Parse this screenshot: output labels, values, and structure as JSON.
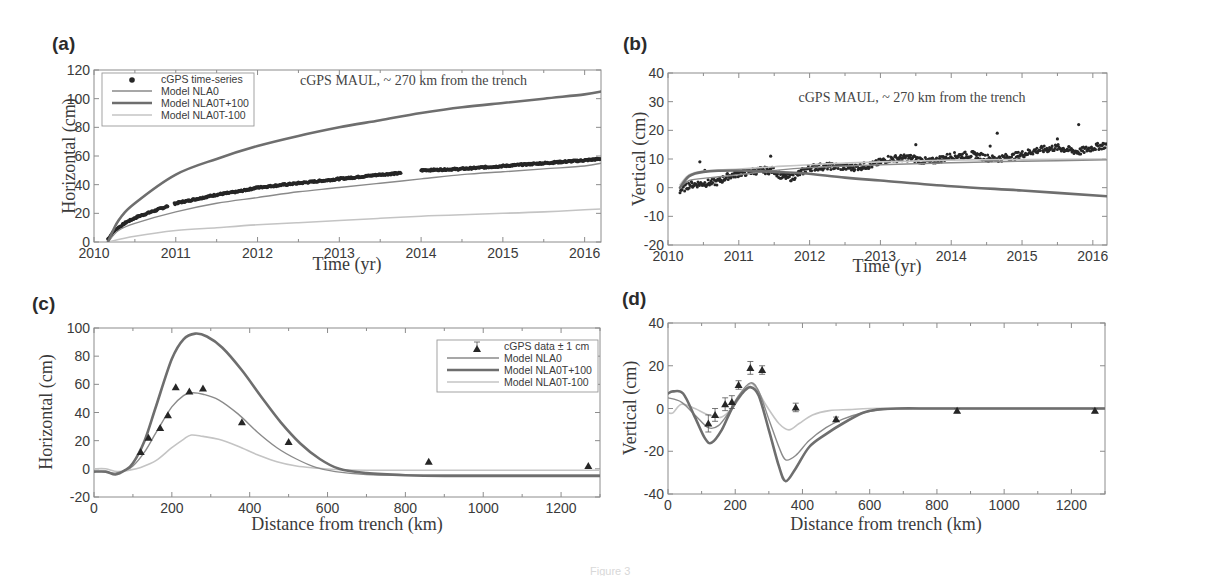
{
  "figure": {
    "caption_fragment": "Figure 3"
  },
  "colors": {
    "nla0": "#8a8a8a",
    "nla0t_plus": "#6e6e6e",
    "nla0t_minus": "#c4c4c4",
    "data": "#262626",
    "axis": "#8c8c8c"
  },
  "chart_data": [
    {
      "panel": "(a)",
      "type": "line",
      "title": "cGPS MAUL, ~ 270 km from the trench",
      "xlabel": "Time (yr)",
      "ylabel": "Horizontal (cm)",
      "xlim": [
        2010,
        2016.2
      ],
      "ylim": [
        0,
        120
      ],
      "xticks": [
        2010,
        2011,
        2012,
        2013,
        2014,
        2015,
        2016
      ],
      "yticks": [
        0,
        20,
        40,
        60,
        80,
        100,
        120
      ],
      "legend": {
        "position": "upper left",
        "entries": [
          "cGPS time-series",
          "Model NLA0",
          "Model NLA0T+100",
          "Model NLA0T-100"
        ]
      },
      "series": [
        {
          "name": "cGPS time-series",
          "kind": "scatter",
          "x": [
            2010.17,
            2010.25,
            2010.4,
            2010.55,
            2010.7,
            2010.85,
            2011.0,
            2011.25,
            2011.5,
            2011.75,
            2012.0,
            2012.5,
            2013.0,
            2013.5,
            2013.75,
            2014.0,
            2014.5,
            2015.0,
            2015.5,
            2016.0,
            2016.2
          ],
          "y": [
            2,
            8,
            14,
            18,
            21,
            24,
            27,
            30,
            33,
            35,
            38,
            41,
            44,
            47,
            48,
            50,
            51,
            53,
            55,
            57,
            58
          ],
          "gaps": [
            [
              2010.9,
              2010.98
            ],
            [
              2013.75,
              2014.0
            ]
          ]
        },
        {
          "name": "Model NLA0",
          "kind": "line",
          "x": [
            2010.17,
            2010.3,
            2010.5,
            2011.0,
            2011.5,
            2012.0,
            2012.5,
            2013.0,
            2013.5,
            2014.0,
            2014.5,
            2015.0,
            2015.5,
            2016.0,
            2016.2
          ],
          "y": [
            0,
            8,
            13,
            21,
            27,
            31,
            35,
            38,
            41,
            44,
            47,
            49,
            51,
            53,
            55
          ]
        },
        {
          "name": "Model NLA0T+100",
          "kind": "line",
          "x": [
            2010.17,
            2010.3,
            2010.5,
            2011.0,
            2011.5,
            2012.0,
            2012.5,
            2013.0,
            2013.5,
            2014.0,
            2014.5,
            2015.0,
            2015.5,
            2016.0,
            2016.2
          ],
          "y": [
            0,
            15,
            27,
            47,
            58,
            67,
            74,
            80,
            85,
            90,
            94,
            97,
            100,
            103,
            105
          ]
        },
        {
          "name": "Model NLA0T-100",
          "kind": "line",
          "x": [
            2010.17,
            2010.5,
            2011.0,
            2011.5,
            2012.0,
            2012.5,
            2013.0,
            2013.5,
            2014.0,
            2014.5,
            2015.0,
            2015.5,
            2016.0,
            2016.2
          ],
          "y": [
            0,
            4,
            8,
            10,
            12,
            13.5,
            15,
            16.5,
            18,
            19,
            20,
            21,
            22.5,
            23
          ]
        }
      ]
    },
    {
      "panel": "(b)",
      "type": "line",
      "title": "cGPS MAUL, ~ 270 km from the trench",
      "xlabel": "Time (yr)",
      "ylabel": "Vertical (cm)",
      "xlim": [
        2010,
        2016.2
      ],
      "ylim": [
        -20,
        40
      ],
      "xticks": [
        2010,
        2011,
        2012,
        2013,
        2014,
        2015,
        2016
      ],
      "yticks": [
        -20,
        -10,
        0,
        10,
        20,
        30,
        40
      ],
      "series": [
        {
          "name": "cGPS time-series",
          "kind": "scatter",
          "x": [
            2010.17,
            2010.3,
            2010.5,
            2010.7,
            2010.85,
            2011.0,
            2011.3,
            2011.5,
            2011.6,
            2011.75,
            2012.0,
            2012.3,
            2012.6,
            2012.9,
            2013.1,
            2013.4,
            2013.7,
            2014.0,
            2014.3,
            2014.6,
            2014.9,
            2015.2,
            2015.5,
            2015.8,
            2016.0,
            2016.2
          ],
          "y": [
            -1,
            1,
            1.5,
            2,
            4,
            5,
            6,
            6,
            4,
            3.5,
            7,
            7.5,
            7,
            8,
            10,
            10.5,
            9,
            11,
            11.5,
            10,
            11,
            13,
            14,
            12.5,
            14,
            15
          ],
          "outliers": {
            "x": [
              2010.45,
              2010.52,
              2011.45,
              2013.5,
              2014.55,
              2014.65,
              2015.5,
              2015.8
            ],
            "y": [
              9,
              6,
              11,
              15,
              14.5,
              19,
              17,
              22
            ]
          }
        },
        {
          "name": "Model NLA0",
          "kind": "line",
          "x": [
            2010.17,
            2010.3,
            2010.6,
            2011.0,
            2011.5,
            2012.0,
            2013.0,
            2014.0,
            2015.0,
            2016.2
          ],
          "y": [
            0,
            2.5,
            3.5,
            4.5,
            6,
            7,
            8,
            8.7,
            9.2,
            9.7
          ]
        },
        {
          "name": "Model NLA0T+100",
          "kind": "line",
          "x": [
            2010.17,
            2010.3,
            2010.5,
            2011.0,
            2011.5,
            2011.9,
            2012.5,
            2013.0,
            2014.0,
            2015.0,
            2016.2
          ],
          "y": [
            0,
            4,
            5.5,
            6,
            5.5,
            5,
            3.5,
            2.5,
            0.5,
            -1,
            -3
          ]
        },
        {
          "name": "Model NLA0T-100",
          "kind": "line",
          "x": [
            2010.17,
            2010.3,
            2010.5,
            2011.0,
            2011.5,
            2012.0,
            2013.0,
            2014.0,
            2015.0,
            2016.2
          ],
          "y": [
            1,
            4.5,
            5.8,
            6.5,
            7.3,
            8,
            9,
            9.6,
            9.8,
            10
          ]
        }
      ]
    },
    {
      "panel": "(c)",
      "type": "line",
      "xlabel": "Distance from trench (km)",
      "ylabel": "Horizontal (cm)",
      "xlim": [
        0,
        1300
      ],
      "ylim": [
        -20,
        100
      ],
      "xticks": [
        0,
        200,
        400,
        600,
        800,
        1000,
        1200
      ],
      "yticks": [
        -20,
        0,
        20,
        40,
        60,
        80,
        100
      ],
      "legend": {
        "position": "upper right",
        "entries": [
          "cGPS data ± 1 cm",
          "Model NLA0",
          "Model NLA0T+100",
          "Model NLA0T-100"
        ]
      },
      "series": [
        {
          "name": "cGPS data ± 1 cm",
          "kind": "scatter-errorbar",
          "x": [
            120,
            140,
            170,
            190,
            210,
            245,
            280,
            380,
            500,
            860,
            1270
          ],
          "y": [
            12,
            22,
            29,
            38,
            58,
            55,
            57,
            33,
            19,
            5,
            2
          ],
          "err": 1
        },
        {
          "name": "Model NLA0",
          "kind": "line",
          "x": [
            0,
            30,
            55,
            80,
            100,
            130,
            160,
            200,
            230,
            250,
            280,
            320,
            370,
            420,
            470,
            520,
            570,
            620,
            700,
            800,
            900,
            1000,
            1100,
            1200,
            1300
          ],
          "y": [
            -2,
            -2,
            -3,
            -1,
            2,
            12,
            26,
            44,
            52,
            54,
            53,
            49,
            39,
            26,
            15,
            7,
            1,
            -2,
            -4,
            -4.5,
            -4.5,
            -4.5,
            -4.5,
            -4.5,
            -4.5
          ]
        },
        {
          "name": "Model NLA0T+100",
          "kind": "line",
          "x": [
            0,
            30,
            55,
            80,
            100,
            130,
            160,
            200,
            230,
            260,
            290,
            330,
            380,
            430,
            480,
            530,
            580,
            630,
            700,
            800,
            900,
            1000,
            1100,
            1200,
            1300
          ],
          "y": [
            -2,
            -2,
            -4,
            -1,
            4,
            20,
            45,
            78,
            92,
            96,
            94,
            86,
            70,
            51,
            33,
            18,
            7,
            0,
            -3,
            -4.5,
            -5,
            -5,
            -5,
            -5,
            -5
          ]
        },
        {
          "name": "Model NLA0T-100",
          "kind": "line",
          "x": [
            0,
            30,
            60,
            90,
            120,
            160,
            200,
            230,
            250,
            280,
            320,
            370,
            420,
            470,
            520,
            570,
            620,
            700,
            800,
            900,
            1000,
            1100,
            1200,
            1300
          ],
          "y": [
            0,
            0,
            -2,
            -1,
            1,
            6,
            15,
            21,
            24,
            23,
            21,
            16,
            10,
            5,
            2,
            0.5,
            -0.5,
            -1,
            -1,
            -1,
            -1,
            -1,
            -1,
            -1
          ]
        }
      ]
    },
    {
      "panel": "(d)",
      "type": "line",
      "xlabel": "Distance from trench (km)",
      "ylabel": "Vertical (cm)",
      "xlim": [
        0,
        1300
      ],
      "ylim": [
        -40,
        40
      ],
      "xticks": [
        0,
        200,
        400,
        600,
        800,
        1000,
        1200
      ],
      "yticks": [
        -40,
        -20,
        0,
        20,
        40
      ],
      "series": [
        {
          "name": "cGPS data ± 1 cm",
          "kind": "scatter-errorbar",
          "x": [
            120,
            140,
            170,
            190,
            210,
            245,
            280,
            380,
            500,
            860,
            1270
          ],
          "y": [
            -7,
            -3,
            2,
            3,
            11,
            19,
            18,
            0.5,
            -5,
            -1,
            -1
          ],
          "err": [
            4,
            3,
            3,
            3,
            2,
            3,
            2,
            2,
            1,
            1,
            1
          ]
        },
        {
          "name": "Model NLA0",
          "kind": "line",
          "x": [
            0,
            40,
            80,
            120,
            150,
            180,
            210,
            245,
            270,
            300,
            330,
            350,
            380,
            420,
            470,
            520,
            580,
            640,
            700,
            800,
            1000,
            1300
          ],
          "y": [
            5,
            3,
            -3,
            -9,
            -8,
            -2,
            6,
            12,
            8,
            -5,
            -18,
            -24,
            -22,
            -15,
            -9,
            -5,
            -2,
            -0.5,
            0,
            0,
            0,
            0
          ]
        },
        {
          "name": "Model NLA0T+100",
          "kind": "line",
          "x": [
            0,
            15,
            45,
            80,
            110,
            130,
            160,
            190,
            220,
            245,
            270,
            300,
            330,
            350,
            380,
            420,
            470,
            520,
            580,
            620,
            680,
            800,
            1000,
            1300
          ],
          "y": [
            7,
            8,
            7,
            -4,
            -14,
            -16,
            -10,
            0,
            7,
            10,
            6,
            -10,
            -27,
            -34,
            -28,
            -18,
            -12,
            -7,
            -2,
            -0.5,
            0,
            0,
            0,
            0
          ]
        },
        {
          "name": "Model NLA0T-100",
          "kind": "line",
          "x": [
            0,
            15,
            40,
            80,
            120,
            160,
            200,
            240,
            260,
            290,
            330,
            360,
            390,
            430,
            480,
            540,
            600,
            700,
            800,
            1000,
            1300
          ],
          "y": [
            -2,
            -2,
            2,
            0,
            -3,
            -4,
            2,
            11,
            10,
            2,
            -7,
            -10,
            -7,
            -3,
            -1,
            -0.5,
            0,
            0,
            0,
            0,
            0
          ]
        }
      ]
    }
  ]
}
